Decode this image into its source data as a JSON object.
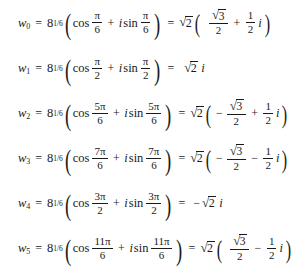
{
  "document": {
    "type": "math-equation-list",
    "description": "Six sixth roots expressed in trigonometric form and rectangular form",
    "background_color": "#ffffff",
    "text_color": "#1a1a1a"
  },
  "symbols": {
    "equals": "=",
    "plus": "+",
    "minus": "−",
    "pi": "π",
    "imaginary_unit": "i",
    "radical": "√",
    "left_paren": "(",
    "right_paren": ")",
    "cos": "cos",
    "sin": "sin",
    "base": "8",
    "exponent": "1/6",
    "two": "2",
    "three": "3",
    "one": "1",
    "variable": "w"
  },
  "equations": [
    {
      "index": "0",
      "label": "w",
      "subscript": "0",
      "base": "8",
      "exponent": "1/6",
      "cos_num": "π",
      "cos_den": "6",
      "sin_num": "π",
      "sin_den": "6",
      "result_coeff_radicand": "2",
      "real_sign": "",
      "real_num": "√3",
      "real_den": "2",
      "imag_op": "+",
      "imag_num": "1",
      "imag_den": "2",
      "form": "full",
      "plain": "w0 = 8^(1/6)(cos pi/6 + i sin pi/6) = sqrt(2)(sqrt(3)/2 + (1/2)i)"
    },
    {
      "index": "1",
      "label": "w",
      "subscript": "1",
      "base": "8",
      "exponent": "1/6",
      "cos_num": "π",
      "cos_den": "2",
      "sin_num": "π",
      "sin_den": "2",
      "result_coeff_radicand": "2",
      "simple_sign": "",
      "simple_imag": "i",
      "form": "simple",
      "plain": "w1 = 8^(1/6)(cos pi/2 + i sin pi/2) = sqrt(2) i"
    },
    {
      "index": "2",
      "label": "w",
      "subscript": "2",
      "base": "8",
      "exponent": "1/6",
      "cos_num": "5π",
      "cos_den": "6",
      "sin_num": "5π",
      "sin_den": "6",
      "result_coeff_radicand": "2",
      "real_sign": "−",
      "real_num": "√3",
      "real_den": "2",
      "imag_op": "+",
      "imag_num": "1",
      "imag_den": "2",
      "form": "full",
      "plain": "w2 = 8^(1/6)(cos 5pi/6 + i sin 5pi/6) = sqrt(2)(-sqrt(3)/2 + (1/2)i)"
    },
    {
      "index": "3",
      "label": "w",
      "subscript": "3",
      "base": "8",
      "exponent": "1/6",
      "cos_num": "7π",
      "cos_den": "6",
      "sin_num": "7π",
      "sin_den": "6",
      "result_coeff_radicand": "2",
      "real_sign": "−",
      "real_num": "√3",
      "real_den": "2",
      "imag_op": "−",
      "imag_num": "1",
      "imag_den": "2",
      "form": "full",
      "plain": "w3 = 8^(1/6)(cos 7pi/6 + i sin 7pi/6) = sqrt(2)(-sqrt(3)/2 - (1/2)i)"
    },
    {
      "index": "4",
      "label": "w",
      "subscript": "4",
      "base": "8",
      "exponent": "1/6",
      "cos_num": "3π",
      "cos_den": "2",
      "sin_num": "3π",
      "sin_den": "2",
      "result_coeff_radicand": "2",
      "simple_sign": "−",
      "simple_imag": "i",
      "form": "simple",
      "plain": "w4 = 8^(1/6)(cos 3pi/2 + i sin 3pi/2) = -sqrt(2) i"
    },
    {
      "index": "5",
      "label": "w",
      "subscript": "5",
      "base": "8",
      "exponent": "1/6",
      "cos_num": "11π",
      "cos_den": "6",
      "sin_num": "11π",
      "sin_den": "6",
      "result_coeff_radicand": "2",
      "real_sign": "",
      "real_num": "√3",
      "real_den": "2",
      "imag_op": "−",
      "imag_num": "1",
      "imag_den": "2",
      "form": "full",
      "plain": "w5 = 8^(1/6)(cos 11pi/6 + i sin 11pi/6) = sqrt(2)(sqrt(3)/2 - (1/2)i)"
    }
  ]
}
